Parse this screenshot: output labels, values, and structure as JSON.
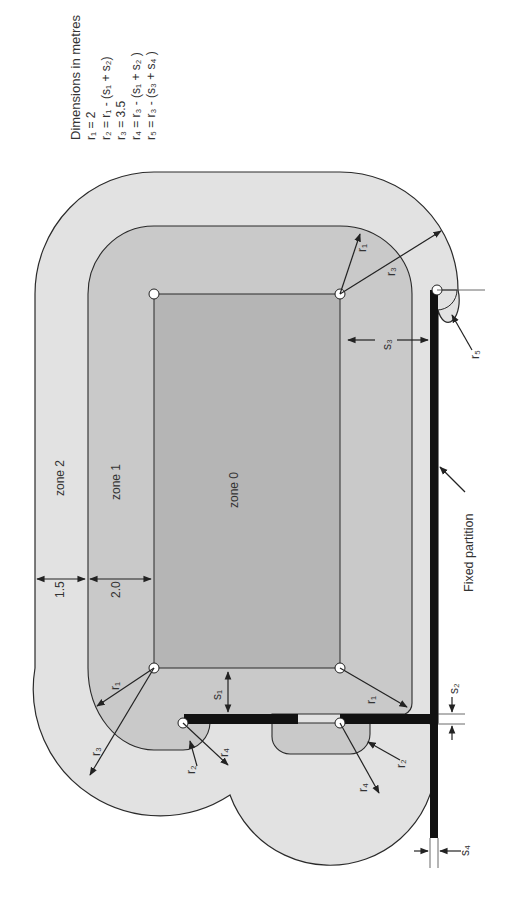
{
  "legend": {
    "title": "Dimensions in metres",
    "lines": [
      "r₁ = 2",
      "r₂ = r₁ - (s₁ + s₂)",
      "r₃ = 3.5",
      "r₄ = r₃ - (s₁ + s₂ )",
      "r₅ = r₃ - (s₃ + s₄ )"
    ]
  },
  "zones": {
    "zone0": "zone 0",
    "zone1": "zone 1",
    "zone2": "zone 2"
  },
  "dimensions": {
    "zone2_width": "1.5",
    "zone1_width": "2.0",
    "s1": "s₁",
    "s2": "s₂",
    "s3": "s₃",
    "s4": "s₄"
  },
  "radii": {
    "r1": "r₁",
    "r2": "r₂",
    "r3": "r₃",
    "r4": "r₄",
    "r5": "r₅"
  },
  "annotations": {
    "fixed_partition": "Fixed partition"
  },
  "colors": {
    "zone0": "#b4b4b4",
    "zone1": "#c8c8c8",
    "zone2": "#e2e2e2",
    "outline": "#2a2a2a",
    "partition": "#111111"
  }
}
